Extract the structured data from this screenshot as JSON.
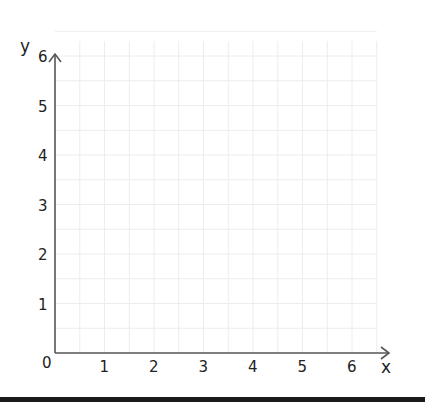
{
  "diagram": {
    "type": "coordinate-grid",
    "x_axis": {
      "label": "x",
      "ticks": [
        "0",
        "1",
        "2",
        "3",
        "4",
        "5",
        "6"
      ],
      "range": [
        0,
        6
      ]
    },
    "y_axis": {
      "label": "y",
      "ticks": [
        "1",
        "2",
        "3",
        "4",
        "5",
        "6"
      ],
      "range": [
        0,
        6
      ]
    },
    "origin_label": "0",
    "grid": {
      "major_step": 1,
      "minor_step": 0.5
    },
    "colors": {
      "axis": "#555555",
      "grid": "#ececec",
      "text": "#222222",
      "bottom_bar": "#1a1a1a"
    }
  }
}
